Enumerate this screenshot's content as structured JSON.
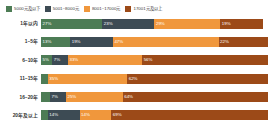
{
  "chart_data": {
    "type": "bar",
    "orientation": "horizontal",
    "stacked": true,
    "normalized": true,
    "title": "",
    "subtitle": "",
    "xlabel": "",
    "ylabel": "",
    "xlim": [
      0,
      100
    ],
    "grid": false,
    "legend_position": "top-left",
    "categories": [
      "1年以内",
      "1~5年",
      "6~10年",
      "11~15年",
      "16~20年",
      "20年及以上"
    ],
    "series": [
      {
        "name": "5000元及以下",
        "color": "#4d7c55",
        "values": [
          27,
          13,
          5,
          3,
          4,
          3
        ]
      },
      {
        "name": "5001~8000元",
        "color": "#3d4b54",
        "values": [
          23,
          19,
          7,
          0,
          7,
          14
        ]
      },
      {
        "name": "8001~17000元",
        "color": "#f0973c",
        "values": [
          29,
          47,
          33,
          35,
          25,
          14
        ]
      },
      {
        "name": "17001元及以上",
        "color": "#9c4a18",
        "values": [
          19,
          22,
          56,
          62,
          64,
          69
        ]
      }
    ],
    "value_labels": [
      [
        "27%",
        "23%",
        "29%",
        "19%"
      ],
      [
        "13%",
        "19%",
        "47%",
        "22%"
      ],
      [
        "5%",
        "7%",
        "33%",
        "56%"
      ],
      [
        "3%",
        "",
        "35%",
        "62%"
      ],
      [
        "4%",
        "7%",
        "25%",
        "64%"
      ],
      [
        "3%",
        "14%",
        "14%",
        "69%"
      ]
    ]
  },
  "legend": {
    "items": [
      {
        "label": "5000元及以下",
        "color": "#4d7c55"
      },
      {
        "label": "5001~8000元",
        "color": "#3d4b54"
      },
      {
        "label": "8001~17000元",
        "color": "#f0973c"
      },
      {
        "label": "17001元及以上",
        "color": "#9c4a18"
      }
    ]
  }
}
